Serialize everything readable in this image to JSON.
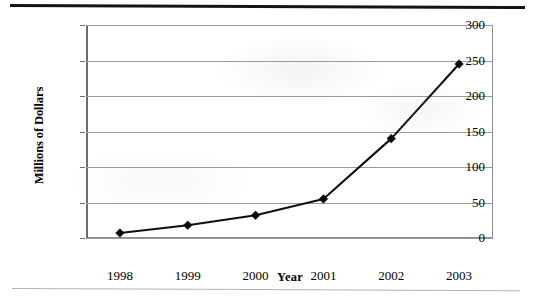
{
  "chart_data": {
    "type": "line",
    "title": "",
    "xlabel": "Year",
    "ylabel": "Millions of Dollars",
    "categories": [
      "1998",
      "1999",
      "2000",
      "2001",
      "2002",
      "2003"
    ],
    "values": [
      7,
      18,
      32,
      55,
      140,
      245
    ],
    "series": [
      {
        "name": "Sales",
        "values": [
          7,
          18,
          32,
          55,
          140,
          245
        ]
      }
    ],
    "ylim": [
      0,
      300
    ],
    "yticks": [
      "0",
      "50",
      "100",
      "150",
      "200",
      "250",
      "300"
    ],
    "ytick_values": [
      0,
      50,
      100,
      150,
      200,
      250,
      300
    ],
    "xtick_labels": [
      "1998",
      "1999",
      "2000",
      "2001",
      "2002",
      "2003"
    ],
    "grid": true,
    "grid_axis": "y",
    "legend": false,
    "legend_position": "none",
    "marker": "diamond",
    "line_color": "#101010",
    "marker_color": "#0a0a0a",
    "gridline_color": "#9a9a9a",
    "plot_background": "#ffffff"
  },
  "figure": {
    "y_axis_title": "Millions of Dollars",
    "x_axis_title": "Year"
  }
}
